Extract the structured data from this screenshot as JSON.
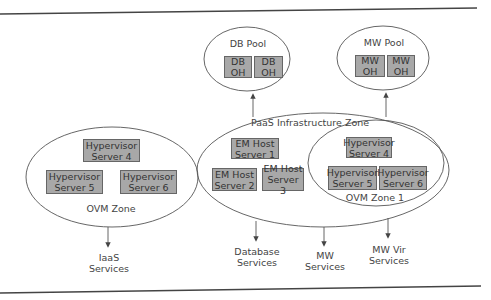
{
  "colors": {
    "box_fill": "#a8a8a8",
    "box_border": "#666666",
    "line": "#555555",
    "rule": "#444444",
    "background": "#ffffff"
  },
  "pools": {
    "db": {
      "title": "DB Pool",
      "nodes": [
        {
          "line1": "DB",
          "line2": "OH"
        },
        {
          "line1": "DB",
          "line2": "OH"
        }
      ]
    },
    "mw": {
      "title": "MW Pool",
      "nodes": [
        {
          "line1": "MW",
          "line2": "OH"
        },
        {
          "line1": "MW",
          "line2": "OH"
        }
      ]
    }
  },
  "ovm_zone": {
    "title": "OVM Zone",
    "servers": [
      {
        "line1": "Hypervisor",
        "line2": "Server 4"
      },
      {
        "line1": "Hypervisor",
        "line2": "Server 5"
      },
      {
        "line1": "Hypervisor",
        "line2": "Server 6"
      }
    ]
  },
  "paas_zone": {
    "title": "PaaS Infrastructure Zone",
    "em_hosts": [
      {
        "line1": "EM Host",
        "line2": "Server 1"
      },
      {
        "line1": "EM Host",
        "line2": "Server 2"
      },
      {
        "line1": "EM Host",
        "line2": "Server 3"
      }
    ],
    "ovm_zone_1": {
      "title": "OVM Zone 1",
      "servers": [
        {
          "line1": "Hypervisor",
          "line2": "Server 4"
        },
        {
          "line1": "Hypervisor",
          "line2": "Server 5"
        },
        {
          "line1": "Hypervisor",
          "line2": "Server 6"
        }
      ]
    }
  },
  "services": {
    "iaas": {
      "line1": "IaaS",
      "line2": "Services"
    },
    "database": {
      "line1": "Database",
      "line2": "Services"
    },
    "mw": {
      "line1": "MW",
      "line2": "Services"
    },
    "mw_vir": {
      "line1": "MW Vir",
      "line2": "Services"
    }
  }
}
